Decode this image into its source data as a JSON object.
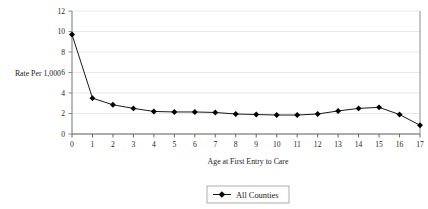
{
  "chart_data": {
    "type": "line",
    "title": "",
    "xlabel": "Age at First Entry to Care",
    "ylabel": "Rate Per 1,000",
    "x": [
      0,
      1,
      2,
      3,
      4,
      5,
      6,
      7,
      8,
      9,
      10,
      11,
      12,
      13,
      14,
      15,
      16,
      17
    ],
    "xtick_labels": [
      "0",
      "1",
      "2",
      "3",
      "4",
      "5",
      "6",
      "7",
      "8",
      "9",
      "10",
      "11",
      "12",
      "13",
      "14",
      "15",
      "16",
      "17"
    ],
    "ytick_labels": [
      "0",
      "2",
      "4",
      "6",
      "8",
      "10",
      "12"
    ],
    "ytick_values": [
      0,
      2,
      4,
      6,
      8,
      10,
      12
    ],
    "xlim": [
      0,
      17
    ],
    "ylim": [
      0,
      12
    ],
    "grid": "horizontal",
    "legend_position": "bottom-center",
    "series": [
      {
        "name": "All Counties",
        "marker": "diamond",
        "color": "#000000",
        "values": [
          9.7,
          3.5,
          2.85,
          2.5,
          2.2,
          2.15,
          2.15,
          2.1,
          1.95,
          1.9,
          1.85,
          1.85,
          1.95,
          2.25,
          2.5,
          2.6,
          1.9,
          0.85
        ]
      }
    ]
  },
  "legend": {
    "entries": [
      {
        "label": "All Counties"
      }
    ]
  },
  "axes": {
    "y_title": "Rate Per 1,000",
    "x_title": "Age at First Entry to Care"
  }
}
